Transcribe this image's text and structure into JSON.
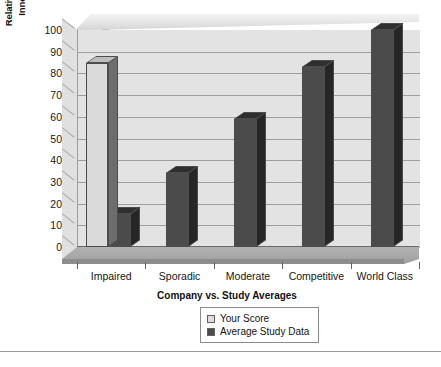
{
  "chart_data": {
    "type": "bar",
    "title": "",
    "xlabel": "Company vs. Study Averages",
    "ylabel": "Relative % Probability of\nInnovation Success",
    "categories": [
      "Impaired",
      "Sporadic",
      "Moderate",
      "Competitive",
      "World Class"
    ],
    "series": [
      {
        "name": "Your Score",
        "color": "#dcdcdc",
        "values": [
          85,
          null,
          null,
          null,
          null
        ]
      },
      {
        "name": "Average Study Data",
        "color": "#4b4b4b",
        "values": [
          15,
          34,
          59,
          83,
          100
        ]
      }
    ],
    "ylim": [
      0,
      100
    ],
    "ytick_labels": [
      "100",
      "90",
      "80",
      "70",
      "60",
      "50",
      "40",
      "30",
      "20",
      "10",
      "0"
    ],
    "ytick_values": [
      100,
      90,
      80,
      70,
      60,
      50,
      40,
      30,
      20,
      10,
      0
    ],
    "grid": true,
    "grid_axis": "y",
    "legend_position": "bottom-center",
    "style": "3d-column",
    "plot_background": "#e3e3e3"
  },
  "legend": {
    "items": [
      {
        "label": "Your Score",
        "swatch": "light"
      },
      {
        "label": "Average Study Data",
        "swatch": "dark"
      }
    ]
  },
  "axes": {
    "y_title": "Relative % Probability of\nInnovation Success",
    "x_title": "Company vs. Study Averages"
  }
}
